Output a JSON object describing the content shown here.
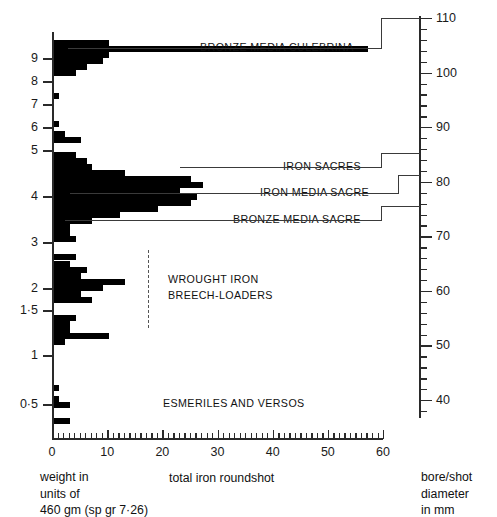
{
  "figure": {
    "x_axis_title": "total iron roundshot",
    "left_caption_lines": [
      "weight in",
      "units of",
      "460 gm (sp gr 7·26)"
    ],
    "right_caption_lines": [
      "bore/shot",
      "diameter",
      "in mm"
    ]
  },
  "chart_data": {
    "type": "bar",
    "orientation": "horizontal",
    "title": "",
    "xlabel": "total iron roundshot",
    "ylabel": "weight in units of 460 gm (sp gr 7·26)",
    "y2label": "bore/shot diameter in mm",
    "xlim": [
      0,
      60
    ],
    "xticks": [
      0,
      10,
      20,
      30,
      40,
      50,
      60
    ],
    "xtick_labels": [
      "0",
      "10",
      "20",
      "30",
      "40",
      "50",
      "60"
    ],
    "xminor_step": 1,
    "yticks": [
      0.5,
      1,
      1.5,
      2,
      3,
      4,
      5,
      6,
      7,
      8,
      9
    ],
    "ytick_labels": [
      "0·5",
      "1",
      "1·5",
      "2",
      "3",
      "4",
      "5",
      "6",
      "7",
      "8",
      "9"
    ],
    "y2ticks": [
      40,
      50,
      60,
      70,
      80,
      90,
      100,
      110
    ],
    "y2tick_labels": [
      "40",
      "50",
      "60",
      "70",
      "80",
      "90",
      "100",
      "110"
    ],
    "y2minor_step": 2,
    "grid": false,
    "legend": "none",
    "bins": [
      {
        "y_px": 40,
        "value": 10
      },
      {
        "y_px": 46,
        "value": 57
      },
      {
        "y_px": 52,
        "value": 10
      },
      {
        "y_px": 58,
        "value": 9
      },
      {
        "y_px": 64,
        "value": 6
      },
      {
        "y_px": 70,
        "value": 4
      },
      {
        "y_px": 93,
        "value": 1
      },
      {
        "y_px": 121,
        "value": 1
      },
      {
        "y_px": 131,
        "value": 2
      },
      {
        "y_px": 137,
        "value": 5
      },
      {
        "y_px": 152,
        "value": 4
      },
      {
        "y_px": 158,
        "value": 6
      },
      {
        "y_px": 164,
        "value": 7
      },
      {
        "y_px": 170,
        "value": 13
      },
      {
        "y_px": 176,
        "value": 25
      },
      {
        "y_px": 182,
        "value": 27
      },
      {
        "y_px": 188,
        "value": 23
      },
      {
        "y_px": 194,
        "value": 26
      },
      {
        "y_px": 200,
        "value": 25
      },
      {
        "y_px": 206,
        "value": 19
      },
      {
        "y_px": 212,
        "value": 12
      },
      {
        "y_px": 218,
        "value": 7
      },
      {
        "y_px": 224,
        "value": 3
      },
      {
        "y_px": 230,
        "value": 3
      },
      {
        "y_px": 236,
        "value": 4
      },
      {
        "y_px": 254,
        "value": 4
      },
      {
        "y_px": 261,
        "value": 3
      },
      {
        "y_px": 267,
        "value": 6
      },
      {
        "y_px": 273,
        "value": 5
      },
      {
        "y_px": 279,
        "value": 13
      },
      {
        "y_px": 285,
        "value": 9
      },
      {
        "y_px": 291,
        "value": 5
      },
      {
        "y_px": 297,
        "value": 7
      },
      {
        "y_px": 315,
        "value": 4
      },
      {
        "y_px": 321,
        "value": 3
      },
      {
        "y_px": 327,
        "value": 3
      },
      {
        "y_px": 333,
        "value": 10
      },
      {
        "y_px": 339,
        "value": 2
      },
      {
        "y_px": 385,
        "value": 1
      },
      {
        "y_px": 396,
        "value": 1
      },
      {
        "y_px": 402,
        "value": 3
      },
      {
        "y_px": 418,
        "value": 3
      }
    ]
  },
  "annotations": [
    {
      "id": "bronze-media-culebrina",
      "label": "BRONZE MEDIA CULEBRINA",
      "text_x": 200,
      "text_y": 42,
      "lead_y": 48,
      "lead_from": 375,
      "lead_to": 68,
      "bracket_x": 381,
      "bracket_to_y": 18
    },
    {
      "id": "iron-sacres",
      "label": "IRON SACRES",
      "text_x": 283,
      "text_y": 161,
      "lead_y": 167,
      "lead_from": 375,
      "lead_to": 180,
      "bracket_x": 381,
      "bracket_to_y": 153
    },
    {
      "id": "iron-media-sacre",
      "label": "IRON MEDIA SACRE",
      "text_x": 260,
      "text_y": 187,
      "lead_y": 193,
      "lead_from": 392,
      "lead_to": 70,
      "bracket_x": 398,
      "bracket_to_y": 175
    },
    {
      "id": "bronze-media-sacre",
      "label": "BRONZE MEDIA SACRE",
      "text_x": 233,
      "text_y": 214,
      "lead_y": 220,
      "lead_from": 375,
      "lead_to": 65,
      "bracket_x": 381,
      "bracket_to_y": 206
    }
  ],
  "group_labels": [
    {
      "id": "wrought-iron-breech-loaders",
      "line1": "WROUGHT IRON",
      "line2": "BREECH-LOADERS",
      "x": 168,
      "y": 272
    },
    {
      "id": "esmeriles-and-versos",
      "line1": "ESMERILES AND VERSOS",
      "line2": "",
      "x": 163,
      "y": 396
    }
  ]
}
